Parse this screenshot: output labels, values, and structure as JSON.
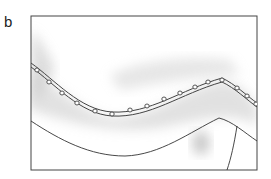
{
  "figure": {
    "panel_label": "b",
    "colors": {
      "frame": "#444444",
      "line": "#333333",
      "shading": "#bdbdbd",
      "background": "#ffffff"
    },
    "elements": [
      {
        "name": "frame",
        "type": "rectangle"
      },
      {
        "name": "beaded-chain",
        "type": "curve",
        "bead_count": 16
      },
      {
        "name": "lower-boundary",
        "type": "curve"
      },
      {
        "name": "branch-line",
        "type": "line"
      },
      {
        "name": "shaded-region",
        "type": "soft-shading"
      }
    ]
  }
}
